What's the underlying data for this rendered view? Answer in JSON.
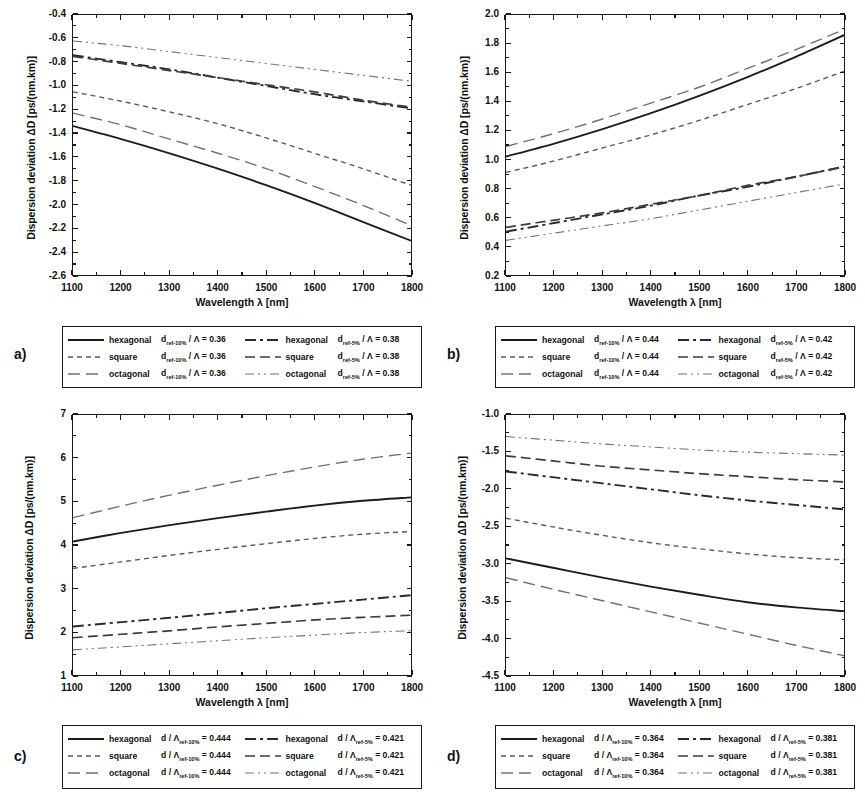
{
  "figure": {
    "axis": {
      "xlabel": "Wavelength λ [nm]",
      "ylabel": "Dispersion deviation ΔD [ps/(nm.km)]"
    }
  },
  "panels": [
    {
      "id": "a",
      "label": "a)",
      "chart_data": {
        "type": "line",
        "title": "",
        "xlabel": "Wavelength λ [nm]",
        "ylabel": "Dispersion deviation ΔD [ps/(nm.km)]",
        "xlim": [
          1100,
          1800
        ],
        "ylim": [
          -2.6,
          -0.4
        ],
        "xticks": [
          1100,
          1200,
          1300,
          1400,
          1500,
          1600,
          1700,
          1800
        ],
        "yticks": [
          -0.4,
          -0.6,
          -0.8,
          -1.0,
          -1.2,
          -1.4,
          -1.6,
          -1.8,
          -2.0,
          -2.2,
          -2.4,
          -2.6
        ],
        "grid": false,
        "legend_position": "below",
        "x": [
          1100,
          1200,
          1300,
          1400,
          1500,
          1600,
          1700,
          1800
        ],
        "series": [
          {
            "name": "hexagonal d_ref-10% / Λ = 0.36",
            "style": "solid",
            "values": [
              -1.34,
              -1.45,
              -1.57,
              -1.7,
              -1.84,
              -1.99,
              -2.15,
              -2.31
            ]
          },
          {
            "name": "square d_ref-10% / Λ = 0.36",
            "style": "long-dash",
            "values": [
              -1.23,
              -1.33,
              -1.45,
              -1.57,
              -1.7,
              -1.85,
              -2.01,
              -2.18
            ]
          },
          {
            "name": "octagonal d_ref-10% / Λ = 0.36",
            "style": "short-dash",
            "values": [
              -1.05,
              -1.13,
              -1.22,
              -1.32,
              -1.44,
              -1.57,
              -1.7,
              -1.84
            ]
          },
          {
            "name": "hexagonal d_ref-5% / Λ = 0.38",
            "style": "dash-dot",
            "values": [
              -0.74,
              -0.8,
              -0.86,
              -0.93,
              -1.0,
              -1.07,
              -1.13,
              -1.19
            ]
          },
          {
            "name": "square d_ref-5% / Λ = 0.38",
            "style": "long-dash-2",
            "values": [
              -0.75,
              -0.81,
              -0.87,
              -0.93,
              -0.99,
              -1.05,
              -1.12,
              -1.18
            ]
          },
          {
            "name": "octagonal d_ref-5% / Λ = 0.38",
            "style": "dash-dot-dot",
            "values": [
              -0.62,
              -0.66,
              -0.71,
              -0.76,
              -0.81,
              -0.86,
              -0.91,
              -0.96
            ]
          }
        ]
      },
      "legend": [
        {
          "marker": "solid",
          "shape": "hexagonal",
          "expr_pre": "d",
          "expr_sub": "ref-10%",
          "expr_post": " / Λ = 0.36"
        },
        {
          "marker": "dash-dot",
          "shape": "hexagonal",
          "expr_pre": "d",
          "expr_sub": "ref-5%",
          "expr_post": " / Λ = 0.38"
        },
        {
          "marker": "short-dash",
          "shape": "square",
          "expr_pre": "d",
          "expr_sub": "ref-10%",
          "expr_post": " / Λ = 0.36"
        },
        {
          "marker": "long-dash-2",
          "shape": "square",
          "expr_pre": "d",
          "expr_sub": "ref-5%",
          "expr_post": " / Λ = 0.38"
        },
        {
          "marker": "long-dash",
          "shape": "octagonal",
          "expr_pre": "d",
          "expr_sub": "ref-10%",
          "expr_post": " / Λ = 0.36"
        },
        {
          "marker": "dash-dot-dot",
          "shape": "octagonal",
          "expr_pre": "d",
          "expr_sub": "ref-5%",
          "expr_post": " / Λ = 0.38"
        }
      ]
    },
    {
      "id": "b",
      "label": "b)",
      "chart_data": {
        "type": "line",
        "title": "",
        "xlabel": "Wavelength λ [nm]",
        "ylabel": "Dispersion deviation ΔD [ps/(nm.km)]",
        "xlim": [
          1100,
          1800
        ],
        "ylim": [
          0.2,
          2.0
        ],
        "xticks": [
          1100,
          1200,
          1300,
          1400,
          1500,
          1600,
          1700,
          1800
        ],
        "yticks": [
          0.2,
          0.4,
          0.6,
          0.8,
          1.0,
          1.2,
          1.4,
          1.6,
          1.8,
          2.0
        ],
        "grid": false,
        "legend_position": "below",
        "x": [
          1100,
          1200,
          1300,
          1400,
          1500,
          1600,
          1700,
          1800
        ],
        "series": [
          {
            "name": "hexagonal d_ref-10% / Λ = 0.44",
            "style": "solid",
            "values": [
              1.02,
              1.11,
              1.21,
              1.32,
              1.44,
              1.57,
              1.71,
              1.86
            ]
          },
          {
            "name": "square d_ref-10% / Λ = 0.44",
            "style": "short-dash",
            "values": [
              0.91,
              0.99,
              1.08,
              1.17,
              1.27,
              1.38,
              1.49,
              1.61
            ]
          },
          {
            "name": "octagonal d_ref-10% / Λ = 0.44",
            "style": "long-dash",
            "values": [
              1.09,
              1.18,
              1.28,
              1.39,
              1.5,
              1.63,
              1.76,
              1.9
            ]
          },
          {
            "name": "hexagonal d_ref-5% / Λ = 0.42",
            "style": "dash-dot",
            "values": [
              0.5,
              0.56,
              0.62,
              0.68,
              0.75,
              0.81,
              0.88,
              0.95
            ]
          },
          {
            "name": "square d_ref-5% / Λ = 0.42",
            "style": "long-dash-2",
            "values": [
              0.53,
              0.58,
              0.63,
              0.69,
              0.75,
              0.82,
              0.88,
              0.95
            ]
          },
          {
            "name": "octagonal d_ref-5% / Λ = 0.42",
            "style": "dash-dot-dot",
            "values": [
              0.44,
              0.49,
              0.54,
              0.59,
              0.65,
              0.71,
              0.77,
              0.83
            ]
          }
        ]
      },
      "legend": [
        {
          "marker": "solid",
          "shape": "hexagonal",
          "expr_pre": "d",
          "expr_sub": "ref-10%",
          "expr_post": " / Λ = 0.44"
        },
        {
          "marker": "dash-dot",
          "shape": "hexagonal",
          "expr_pre": "d",
          "expr_sub": "ref-5%",
          "expr_post": " / Λ = 0.42"
        },
        {
          "marker": "short-dash",
          "shape": "square",
          "expr_pre": "d",
          "expr_sub": "ref-10%",
          "expr_post": " / Λ = 0.44"
        },
        {
          "marker": "long-dash-2",
          "shape": "square",
          "expr_pre": "d",
          "expr_sub": "ref-5%",
          "expr_post": " / Λ = 0.42"
        },
        {
          "marker": "long-dash",
          "shape": "octagonal",
          "expr_pre": "d",
          "expr_sub": "ref-10%",
          "expr_post": " / Λ = 0.44"
        },
        {
          "marker": "dash-dot-dot",
          "shape": "octagonal",
          "expr_pre": "d",
          "expr_sub": "ref-5%",
          "expr_post": " / Λ = 0.42"
        }
      ]
    },
    {
      "id": "c",
      "label": "c)",
      "chart_data": {
        "type": "line",
        "title": "",
        "xlabel": "Wavelength λ [nm]",
        "ylabel": "Dispersion deviation ΔD [ps/(nm.km)]",
        "xlim": [
          1100,
          1800
        ],
        "ylim": [
          1,
          7
        ],
        "xticks": [
          1100,
          1200,
          1300,
          1400,
          1500,
          1600,
          1700,
          1800
        ],
        "yticks": [
          1,
          2,
          3,
          4,
          5,
          6,
          7
        ],
        "grid": false,
        "legend_position": "below",
        "x": [
          1100,
          1200,
          1300,
          1400,
          1500,
          1600,
          1700,
          1800
        ],
        "series": [
          {
            "name": "hexagonal d / Λ_ref-10% = 0.444",
            "style": "solid",
            "values": [
              4.08,
              4.28,
              4.46,
              4.62,
              4.77,
              4.91,
              5.02,
              5.1
            ]
          },
          {
            "name": "square d / Λ_ref-10% = 0.444",
            "style": "short-dash",
            "values": [
              3.46,
              3.61,
              3.76,
              3.9,
              4.03,
              4.15,
              4.25,
              4.31
            ]
          },
          {
            "name": "octagonal d / Λ_ref-10% = 0.444",
            "style": "long-dash",
            "values": [
              4.63,
              4.9,
              5.15,
              5.38,
              5.6,
              5.8,
              5.98,
              6.12
            ]
          },
          {
            "name": "hexagonal d / Λ_ref-5% = 0.421",
            "style": "dash-dot",
            "values": [
              2.12,
              2.22,
              2.32,
              2.43,
              2.54,
              2.64,
              2.74,
              2.84
            ]
          },
          {
            "name": "square d / Λ_ref-5% = 0.421",
            "style": "long-dash-2",
            "values": [
              1.86,
              1.94,
              2.02,
              2.11,
              2.19,
              2.27,
              2.33,
              2.38
            ]
          },
          {
            "name": "octagonal d / Λ_ref-5% = 0.421",
            "style": "dash-dot-dot",
            "values": [
              1.58,
              1.65,
              1.72,
              1.79,
              1.86,
              1.92,
              1.98,
              2.02
            ]
          }
        ]
      },
      "legend": [
        {
          "marker": "solid",
          "shape": "hexagonal",
          "expr_pre": "d / Λ",
          "expr_sub": "ref-10%",
          "expr_post": " = 0.444"
        },
        {
          "marker": "dash-dot",
          "shape": "hexagonal",
          "expr_pre": "d / Λ",
          "expr_sub": "ref-5%",
          "expr_post": " = 0.421"
        },
        {
          "marker": "short-dash",
          "shape": "square",
          "expr_pre": "d / Λ",
          "expr_sub": "ref-10%",
          "expr_post": " = 0.444"
        },
        {
          "marker": "long-dash-2",
          "shape": "square",
          "expr_pre": "d / Λ",
          "expr_sub": "ref-5%",
          "expr_post": " = 0.421"
        },
        {
          "marker": "long-dash",
          "shape": "octagonal",
          "expr_pre": "d / Λ",
          "expr_sub": "ref-10%",
          "expr_post": " = 0.444"
        },
        {
          "marker": "dash-dot-dot",
          "shape": "octagonal",
          "expr_pre": "d / Λ",
          "expr_sub": "ref-5%",
          "expr_post": " = 0.421"
        }
      ]
    },
    {
      "id": "d",
      "label": "d)",
      "chart_data": {
        "type": "line",
        "title": "",
        "xlabel": "Wavelength λ [nm]",
        "ylabel": "Dispersion deviation ΔD [ps/(nm.km)]",
        "xlim": [
          1100,
          1800
        ],
        "ylim": [
          -4.5,
          -1.0
        ],
        "xticks": [
          1100,
          1200,
          1300,
          1400,
          1500,
          1600,
          1700,
          1800
        ],
        "yticks": [
          -1.0,
          -1.5,
          -2.0,
          -2.5,
          -3.0,
          -3.5,
          -4.0,
          -4.5
        ],
        "grid": false,
        "legend_position": "below",
        "x": [
          1100,
          1200,
          1300,
          1400,
          1500,
          1600,
          1700,
          1800
        ],
        "series": [
          {
            "name": "hexagonal d / Λ_ref-10% = 0.364",
            "style": "solid",
            "values": [
              -2.93,
              -3.06,
              -3.19,
              -3.31,
              -3.42,
              -3.52,
              -3.59,
              -3.64
            ]
          },
          {
            "name": "square d / Λ_ref-10% = 0.364",
            "style": "short-dash",
            "values": [
              -2.39,
              -2.51,
              -2.62,
              -2.72,
              -2.8,
              -2.87,
              -2.92,
              -2.95
            ]
          },
          {
            "name": "octagonal d / Λ_ref-10% = 0.364",
            "style": "long-dash",
            "values": [
              -3.19,
              -3.35,
              -3.5,
              -3.65,
              -3.8,
              -3.95,
              -4.1,
              -4.24
            ]
          },
          {
            "name": "hexagonal d / Λ_ref-5% = 0.381",
            "style": "dash-dot",
            "values": [
              -1.76,
              -1.84,
              -1.92,
              -2.0,
              -2.08,
              -2.15,
              -2.21,
              -2.27
            ]
          },
          {
            "name": "square d / Λ_ref-5% = 0.381",
            "style": "long-dash-2",
            "values": [
              -1.55,
              -1.62,
              -1.69,
              -1.74,
              -1.79,
              -1.83,
              -1.87,
              -1.9
            ]
          },
          {
            "name": "octagonal d / Λ_ref-5% = 0.381",
            "style": "dash-dot-dot",
            "values": [
              -1.29,
              -1.34,
              -1.39,
              -1.43,
              -1.47,
              -1.5,
              -1.52,
              -1.54
            ]
          }
        ]
      },
      "legend": [
        {
          "marker": "solid",
          "shape": "hexagonal",
          "expr_pre": "d / Λ",
          "expr_sub": "ref-10%",
          "expr_post": " = 0.364"
        },
        {
          "marker": "dash-dot",
          "shape": "hexagonal",
          "expr_pre": "d / Λ",
          "expr_sub": "ref-5%",
          "expr_post": " = 0.381"
        },
        {
          "marker": "short-dash",
          "shape": "square",
          "expr_pre": "d / Λ",
          "expr_sub": "ref-10%",
          "expr_post": " = 0.364"
        },
        {
          "marker": "long-dash-2",
          "shape": "square",
          "expr_pre": "d / Λ",
          "expr_sub": "ref-5%",
          "expr_post": " = 0.381"
        },
        {
          "marker": "long-dash",
          "shape": "octagonal",
          "expr_pre": "d / Λ",
          "expr_sub": "ref-10%",
          "expr_post": " = 0.364"
        },
        {
          "marker": "dash-dot-dot",
          "shape": "octagonal",
          "expr_pre": "d / Λ",
          "expr_sub": "ref-5%",
          "expr_post": " = 0.381"
        }
      ]
    }
  ]
}
